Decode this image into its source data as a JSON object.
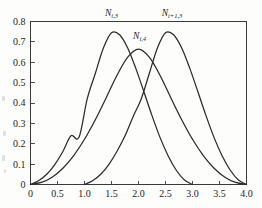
{
  "figure": {
    "name": "b-spline-basis-functions-figure",
    "background_color": "#fdfdfc",
    "axis_color": "#3a3a3a",
    "curve_color": "#2b2b2b"
  },
  "chart_data": {
    "type": "line",
    "title": "",
    "subtitle": "",
    "xlabel": "",
    "ylabel": "",
    "xlim": [
      0,
      4.0
    ],
    "ylim": [
      0,
      0.8
    ],
    "grid": false,
    "legend_position": "inline-annotations",
    "x_ticks": [
      0,
      0.5,
      1.0,
      1.5,
      2.0,
      2.5,
      3.0,
      3.5,
      4.0
    ],
    "x_tick_labels": [
      "0",
      "0.5",
      "1.0",
      "1.5",
      "2.0",
      "2.5",
      "3.0",
      "3.5",
      "4.0"
    ],
    "y_ticks": [
      0,
      0.1,
      0.2,
      0.3,
      0.4,
      0.5,
      0.6,
      0.7,
      0.8
    ],
    "y_tick_labels": [
      "0",
      "0.1",
      "0.2",
      "0.3",
      "0.4",
      "0.5",
      "0.6",
      "0.7",
      "0.8"
    ],
    "annotations": [
      {
        "id": "left-curve-label",
        "base": "N",
        "sub": "i,3",
        "text": "N i,3",
        "x": 1.5,
        "y": 0.86
      },
      {
        "id": "middle-curve-label",
        "base": "N",
        "sub": "i,4",
        "text": "N i,4",
        "x": 2.02,
        "y": 0.715
      },
      {
        "id": "right-curve-label",
        "base": "N",
        "sub": "i+1,3",
        "text": "N i+1,3",
        "x": 2.62,
        "y": 0.86
      }
    ],
    "series": [
      {
        "name": "N i,3",
        "label_base": "N",
        "label_sub": "i,3",
        "peak_x": 1.5,
        "peak_y": 0.745,
        "support": [
          0.0,
          3.0
        ],
        "x": [
          0.0,
          0.15,
          0.3,
          0.45,
          0.6,
          0.75,
          0.9,
          1.05,
          1.2,
          1.35,
          1.5,
          1.65,
          1.8,
          1.95,
          2.1,
          2.25,
          2.4,
          2.55,
          2.7,
          2.85,
          3.0
        ],
        "values": [
          0.0,
          0.018,
          0.05,
          0.098,
          0.162,
          0.239,
          0.233,
          0.42,
          0.545,
          0.67,
          0.745,
          0.735,
          0.67,
          0.57,
          0.455,
          0.338,
          0.23,
          0.14,
          0.07,
          0.022,
          0.0
        ]
      },
      {
        "name": "N i,4",
        "label_base": "N",
        "label_sub": "i,4",
        "peak_x": 2.0,
        "peak_y": 0.665,
        "support": [
          0.0,
          4.0
        ],
        "x": [
          0.0,
          0.2,
          0.4,
          0.6,
          0.8,
          1.0,
          1.2,
          1.4,
          1.6,
          1.8,
          2.0,
          2.2,
          2.4,
          2.6,
          2.8,
          3.0,
          3.2,
          3.4,
          3.6,
          3.8,
          4.0
        ],
        "values": [
          0.0,
          0.01,
          0.036,
          0.08,
          0.142,
          0.222,
          0.318,
          0.425,
          0.535,
          0.625,
          0.665,
          0.625,
          0.535,
          0.425,
          0.318,
          0.222,
          0.142,
          0.08,
          0.036,
          0.01,
          0.0
        ]
      },
      {
        "name": "N i+1,3",
        "label_base": "N",
        "label_sub": "i+1,3",
        "peak_x": 2.5,
        "peak_y": 0.745,
        "support": [
          1.0,
          4.0
        ],
        "x": [
          1.0,
          1.15,
          1.3,
          1.45,
          1.6,
          1.75,
          1.9,
          2.05,
          2.2,
          2.35,
          2.5,
          2.65,
          2.8,
          2.95,
          3.1,
          3.25,
          3.4,
          3.55,
          3.7,
          3.85,
          4.0
        ],
        "values": [
          0.0,
          0.018,
          0.05,
          0.098,
          0.162,
          0.239,
          0.333,
          0.42,
          0.545,
          0.67,
          0.745,
          0.735,
          0.67,
          0.57,
          0.455,
          0.338,
          0.23,
          0.14,
          0.07,
          0.022,
          0.0
        ]
      }
    ]
  }
}
